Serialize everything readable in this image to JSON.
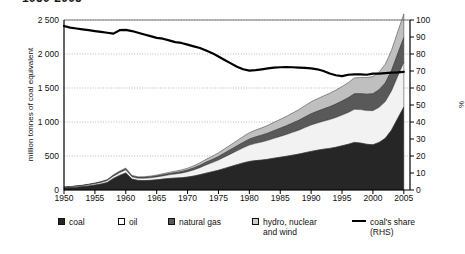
{
  "chart_data": {
    "type": "area",
    "title": "1950-2005",
    "title_clipped": true,
    "xlabel": "",
    "ylabel": "million tonnes of coal equivalent",
    "y2label": "%",
    "xlim": [
      1950,
      2006
    ],
    "ylim": [
      0,
      2500
    ],
    "y2lim": [
      0,
      100
    ],
    "grid": true,
    "legend_position": "bottom",
    "x_ticks": [
      "1950",
      "1955",
      "1960",
      "1965",
      "1970",
      "1975",
      "1980",
      "1985",
      "1990",
      "1995",
      "2000",
      "2005"
    ],
    "y_ticks": [
      "0",
      "500",
      "1 000",
      "1 500",
      "2 000",
      "2 500"
    ],
    "y2_ticks": [
      "0",
      "10",
      "20",
      "30",
      "40",
      "50",
      "60",
      "70",
      "80",
      "90",
      "100"
    ],
    "x": [
      1950,
      1951,
      1952,
      1953,
      1954,
      1955,
      1956,
      1957,
      1958,
      1959,
      1960,
      1961,
      1962,
      1963,
      1964,
      1965,
      1966,
      1967,
      1968,
      1969,
      1970,
      1971,
      1972,
      1973,
      1974,
      1975,
      1976,
      1977,
      1978,
      1979,
      1980,
      1981,
      1982,
      1983,
      1984,
      1985,
      1986,
      1987,
      1988,
      1989,
      1990,
      1991,
      1992,
      1993,
      1994,
      1995,
      1996,
      1997,
      1998,
      1999,
      2000,
      2001,
      2002,
      2003,
      2004,
      2005
    ],
    "series": [
      {
        "name": "coal",
        "color": "#262626",
        "values": [
          30,
          36,
          42,
          50,
          60,
          72,
          88,
          110,
          170,
          215,
          250,
          160,
          140,
          138,
          142,
          150,
          160,
          170,
          175,
          180,
          190,
          205,
          225,
          248,
          268,
          290,
          318,
          345,
          372,
          398,
          420,
          432,
          440,
          452,
          468,
          482,
          496,
          512,
          528,
          548,
          568,
          585,
          600,
          612,
          628,
          650,
          672,
          700,
          690,
          672,
          665,
          700,
          760,
          880,
          1050,
          1220
        ]
      },
      {
        "name": "oil",
        "color": "#f2f2f2",
        "values": [
          8,
          10,
          12,
          14,
          17,
          20,
          24,
          28,
          34,
          40,
          46,
          34,
          33,
          35,
          38,
          42,
          47,
          53,
          60,
          68,
          78,
          90,
          104,
          120,
          135,
          150,
          168,
          186,
          204,
          222,
          240,
          254,
          266,
          278,
          292,
          306,
          320,
          336,
          352,
          370,
          388,
          400,
          412,
          424,
          438,
          452,
          468,
          486,
          492,
          496,
          502,
          516,
          540,
          576,
          620,
          660
        ]
      },
      {
        "name": "natural gas",
        "color": "#595959",
        "values": [
          2,
          2,
          3,
          3,
          4,
          5,
          6,
          7,
          9,
          11,
          13,
          10,
          10,
          11,
          12,
          13,
          15,
          17,
          19,
          22,
          25,
          29,
          34,
          40,
          45,
          51,
          58,
          65,
          72,
          80,
          88,
          94,
          100,
          106,
          113,
          120,
          128,
          136,
          145,
          155,
          165,
          172,
          180,
          188,
          197,
          206,
          216,
          228,
          234,
          240,
          248,
          258,
          274,
          298,
          330,
          360
        ]
      },
      {
        "name": "hydro, nuclear and wind",
        "color": "#bfbfbf",
        "values": [
          3,
          3,
          4,
          4,
          5,
          6,
          7,
          8,
          10,
          12,
          14,
          11,
          11,
          12,
          13,
          15,
          17,
          19,
          22,
          25,
          28,
          32,
          37,
          43,
          49,
          55,
          62,
          70,
          78,
          86,
          94,
          101,
          108,
          115,
          123,
          131,
          139,
          148,
          157,
          167,
          177,
          184,
          191,
          198,
          206,
          214,
          223,
          234,
          240,
          246,
          253,
          262,
          276,
          298,
          325,
          350
        ]
      }
    ],
    "line_series": {
      "name": "coal's share (RHS)",
      "axis": "right",
      "color": "#000000",
      "values": [
        96.5,
        95.5,
        95,
        94.5,
        94,
        93.5,
        93,
        92.5,
        92,
        94,
        94.2,
        93.5,
        92.5,
        91.5,
        90.5,
        89.5,
        89,
        88,
        87,
        86.5,
        85.5,
        84.5,
        83.5,
        82,
        80.5,
        78.5,
        76.5,
        74.5,
        72.5,
        71,
        70.2,
        70.5,
        71,
        71.5,
        72,
        72.2,
        72.3,
        72.2,
        72,
        71.8,
        71.5,
        71,
        70,
        68.5,
        67.5,
        67,
        67.8,
        68,
        68,
        67.8,
        68.5,
        68.5,
        68.8,
        69,
        69.2,
        69.5
      ]
    }
  },
  "legend": {
    "items": [
      {
        "label": "coal",
        "swatch": "square-dark",
        "x": 58
      },
      {
        "label": "oil",
        "swatch": "square-white",
        "x": 118
      },
      {
        "label": "natural gas",
        "swatch": "square-gray",
        "x": 168
      },
      {
        "label": "hydro, nuclear",
        "label2": "and wind",
        "swatch": "square-light",
        "x": 252
      },
      {
        "label": "coal's share",
        "label2": "(RHS)",
        "swatch": "line",
        "x": 352
      }
    ]
  }
}
